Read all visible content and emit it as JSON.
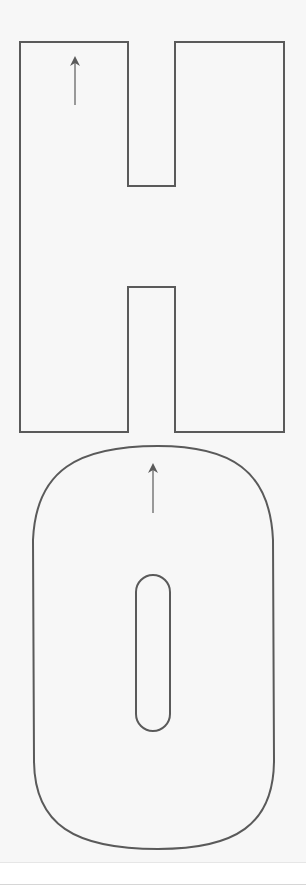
{
  "figure": {
    "description": "Letter tracing outlines for the word HO with stroke-direction arrows",
    "letters": [
      {
        "char": "H",
        "shape": "H outline",
        "arrow_direction": "up"
      },
      {
        "char": "O",
        "shape": "rounded O outline with inner slot",
        "arrow_direction": "up"
      }
    ],
    "colors": {
      "background": "#f7f7f7",
      "stroke": "#5a5a5a",
      "footer": "#ffffff"
    }
  }
}
